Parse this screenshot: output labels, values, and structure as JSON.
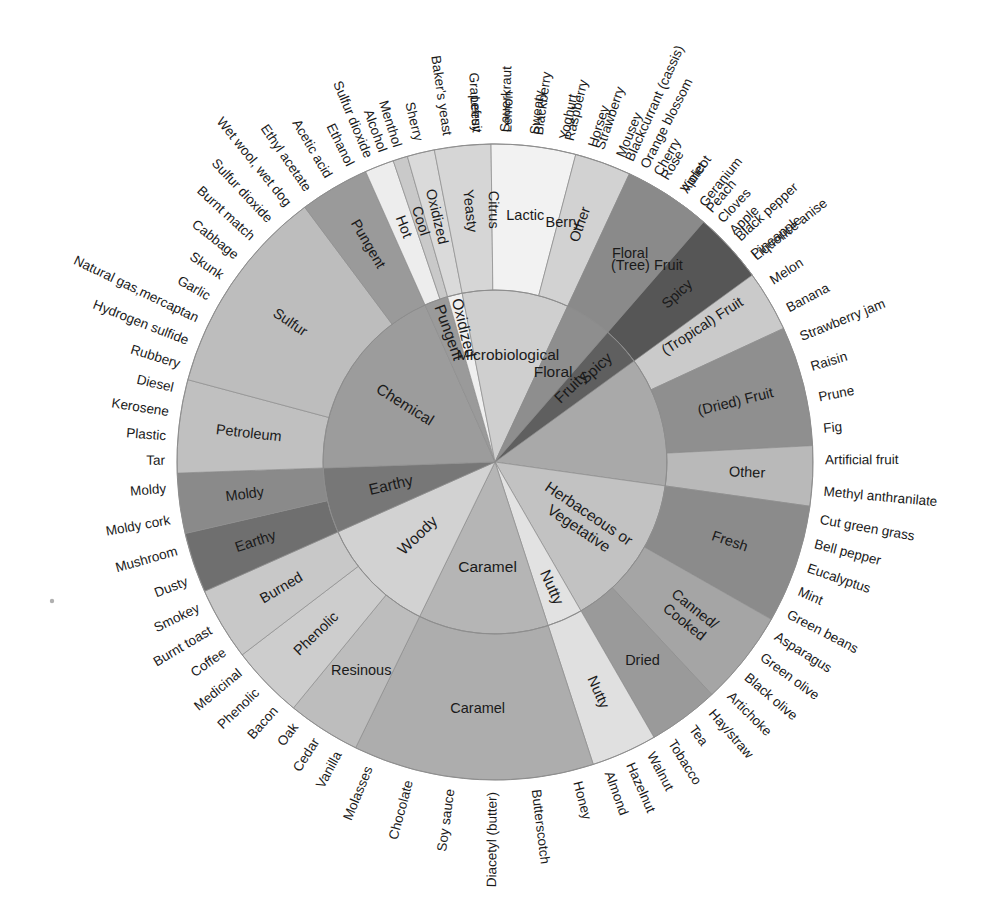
{
  "figure": {
    "name": "wine-aroma-wheel",
    "type": "sunburst",
    "center": [
      495,
      462
    ],
    "radii": {
      "inner_ring_outer": 172,
      "mid_ring_outer": 318,
      "leaf_text": 330
    },
    "palette": {
      "fruity": "#a9a9a9",
      "spicy": "#5f5f5f",
      "floral": "#8e8e8e",
      "microbiological": "#cfcfcf",
      "oxidized": "#efefef",
      "pungent": "#9a9a9a",
      "chemical": "#9c9c9c",
      "earthy": "#777777",
      "woody": "#d2d2d2",
      "caramel": "#b5b5b5",
      "nutty": "#e2e2e2",
      "herbaceous": "#c2c2c2",
      "stroke": "#8d8d8d",
      "text": "#1a1a1a"
    }
  },
  "chart_data": {
    "type": "pie",
    "levels": 3,
    "legend": "none",
    "grid": false,
    "rings": [
      "category",
      "subcategory",
      "descriptor"
    ],
    "categories": [
      {
        "label": "Fruity",
        "color": "#a9a9a9",
        "start_angle": -6,
        "sweep": 104,
        "subcategories": [
          {
            "label": "Citrus",
            "color": "#b6b6b6",
            "leaves": [
              "Grapefruit",
              "Lemon"
            ]
          },
          {
            "label": "Berry",
            "color": "#adadad",
            "leaves": [
              "Blackberry",
              "Raspberry",
              "Strawberry",
              "Blackcurrant (cassis)"
            ]
          },
          {
            "label": "(Tree) Fruit",
            "color": "#9e9e9e",
            "leaves": [
              "Cherry",
              "Apricot",
              "Peach",
              "Apple"
            ]
          },
          {
            "label": "(Tropical) Fruit",
            "color": "#cacaca",
            "leaves": [
              "Pineapple",
              "Melon",
              "Banana"
            ]
          },
          {
            "label": "(Dried) Fruit",
            "color": "#8f8f8f",
            "leaves": [
              "Strawberry jam",
              "Raisin",
              "Prune",
              "Fig"
            ]
          },
          {
            "label": "Other",
            "color": "#b9b9b9",
            "leaves": [
              "Artificial fruit",
              "Methyl anthranilate"
            ]
          }
        ]
      },
      {
        "label": "Herbaceous or Vegetative",
        "color": "#c2c2c2",
        "start_angle": 98,
        "sweep": 52,
        "subcategories": [
          {
            "label": "Fresh",
            "color": "#8b8b8b",
            "leaves": [
              "Cut green grass",
              "Bell pepper",
              "Eucalyptus",
              "Mint",
              "Green beans"
            ]
          },
          {
            "label": "Canned/ Cooked",
            "color": "#a5a5a5",
            "leaves": [
              "Asparagus",
              "Green olive",
              "Black olive",
              "Artichoke"
            ]
          },
          {
            "label": "Dried",
            "color": "#9a9a9a",
            "leaves": [
              "Hay/straw",
              "Tea",
              "Tobacco"
            ]
          }
        ]
      },
      {
        "label": "Nutty",
        "color": "#e2e2e2",
        "start_angle": 150,
        "sweep": 12,
        "subcategories": [
          {
            "label": "Nutty",
            "color": "#e0e0e0",
            "leaves": [
              "Walnut",
              "Hazelnut",
              "Almond"
            ]
          }
        ]
      },
      {
        "label": "Caramel",
        "color": "#b5b5b5",
        "start_angle": 162,
        "sweep": 44,
        "subcategories": [
          {
            "label": "Caramel",
            "color": "#adadad",
            "leaves": [
              "Honey",
              "Butterscotch",
              "Diacetyl (butter)",
              "Soy sauce",
              "Chocolate",
              "Molasses"
            ]
          }
        ]
      },
      {
        "label": "Woody",
        "color": "#d2d2d2",
        "start_angle": 206,
        "sweep": 40,
        "subcategories": [
          {
            "label": "Resinous",
            "color": "#bdbdbd",
            "leaves": [
              "Vanilla",
              "Cedar",
              "Oak"
            ]
          },
          {
            "label": "Phenolic",
            "color": "#cdcdcd",
            "leaves": [
              "Bacon",
              "Phenolic",
              "Medicinal"
            ]
          },
          {
            "label": "Burned",
            "color": "#c8c8c8",
            "leaves": [
              "Coffee",
              "Burnt toast",
              "Smokey"
            ]
          }
        ]
      },
      {
        "label": "Earthy",
        "color": "#777777",
        "start_angle": 246,
        "sweep": 22,
        "subcategories": [
          {
            "label": "Earthy",
            "color": "#6f6f6f",
            "leaves": [
              "Dusty",
              "Mushroom"
            ]
          },
          {
            "label": "Moldy",
            "color": "#8a8a8a",
            "leaves": [
              "Moldy cork",
              "Moldy"
            ]
          }
        ]
      },
      {
        "label": "Chemical",
        "color": "#9c9c9c",
        "start_angle": 268,
        "sweep": 68,
        "subcategories": [
          {
            "label": "Petroleum",
            "color": "#c0c0c0",
            "leaves": [
              "Tar",
              "Plastic",
              "Kerosene",
              "Diesel"
            ]
          },
          {
            "label": "Sulfur",
            "color": "#bdbdbd",
            "leaves": [
              "Rubbery",
              "Hydrogen sulfide",
              "Natural gas,mercaptan",
              "Garlic",
              "Skunk",
              "Cabbage",
              "Burnt match",
              "Sulfur dioxide",
              "Wet wool, wet dog"
            ]
          },
          {
            "label": "Pungent",
            "color": "#9a9a9a",
            "leaves": [
              "Ethyl acetate",
              "Acetic acid",
              "Ethanol"
            ]
          }
        ]
      },
      {
        "label": "Pungent",
        "color": "#9a9a9a",
        "start_angle": 336,
        "sweep": 8,
        "subcategories": [
          {
            "label": "Hot",
            "color": "#ededed",
            "leaves": [
              "Sulfur dioxide",
              "Alcohol"
            ]
          },
          {
            "label": "Cool",
            "color": "#c9c9c9",
            "leaves": [
              "Menthol"
            ]
          }
        ]
      },
      {
        "label": "Oxidized",
        "color": "#efefef",
        "start_angle": 344,
        "sweep": 5,
        "subcategories": [
          {
            "label": "Oxidized",
            "color": "#dadada",
            "leaves": [
              "Sherry"
            ]
          }
        ]
      },
      {
        "label": "Microbiological",
        "color": "#cfcfcf",
        "start_angle": 349,
        "sweep": 36,
        "subcategories": [
          {
            "label": "Yeasty",
            "color": "#d6d6d6",
            "leaves": [
              "Baker's yeast",
              "Leesy"
            ]
          },
          {
            "label": "Lactic",
            "color": "#f2f2f2",
            "leaves": [
              "Sauerkraut",
              "Sweaty",
              "Yoghurt"
            ]
          },
          {
            "label": "Other",
            "color": "#d2d2d2",
            "leaves": [
              "Horsey",
              "Mousey"
            ]
          }
        ]
      },
      {
        "label": "Floral",
        "color": "#8e8e8e",
        "start_angle": 25,
        "sweep": 16,
        "subcategories": [
          {
            "label": "Floral",
            "color": "#8a8a8a",
            "leaves": [
              "Orange blossom",
              "Rose",
              "Violet",
              "Geranium"
            ]
          }
        ]
      },
      {
        "label": "Spicy",
        "color": "#5f5f5f",
        "start_angle": 41,
        "sweep": 13,
        "subcategories": [
          {
            "label": "Spicy",
            "color": "#565656",
            "leaves": [
              "Cloves",
              "Black pepper",
              "Liquorice anise"
            ]
          }
        ]
      }
    ],
    "leaf_sequence_clockwise_from_top": [
      "Sulfur dioxide",
      "Alcohol",
      "Menthol",
      "Sherry",
      "Baker's yeast",
      "Leesy",
      "Sauerkraut",
      "Sweaty",
      "Yoghurt",
      "Horsey",
      "Mousey",
      "Orange blossom",
      "Rose",
      "Violet",
      "Geranium",
      "Cloves",
      "Black pepper",
      "Liquorice anise",
      "Grapefruit",
      "Lemon",
      "Blackberry",
      "Raspberry",
      "Strawberry",
      "Blackcurrant (cassis)",
      "Cherry",
      "Apricot",
      "Peach",
      "Apple",
      "Pineapple",
      "Melon",
      "Banana",
      "Strawberry jam",
      "Raisin",
      "Prune",
      "Fig",
      "Artificial fruit",
      "Methyl anthranilate",
      "Cut green grass",
      "Bell pepper",
      "Eucalyptus",
      "Mint",
      "Green beans",
      "Asparagus",
      "Green olive",
      "Black olive",
      "Artichoke",
      "Hay/straw",
      "Tea",
      "Tobacco",
      "Walnut",
      "Hazelnut",
      "Almond",
      "Honey",
      "Butterscotch",
      "Diacetyl (butter)",
      "Soy sauce",
      "Chocolate",
      "Molasses",
      "Vanilla",
      "Cedar",
      "Oak",
      "Bacon",
      "Phenolic",
      "Medicinal",
      "Coffee",
      "Burnt toast",
      "Smokey",
      "Dusty",
      "Mushroom",
      "Moldy cork",
      "Moldy",
      "Tar",
      "Plastic",
      "Kerosene",
      "Diesel",
      "Rubbery",
      "Hydrogen sulfide",
      "Natural gas,mercaptan",
      "Garlic",
      "Skunk",
      "Cabbage",
      "Burnt match",
      "Sulfur dioxide",
      "Wet wool, wet dog",
      "Ethyl acetate",
      "Acetic acid",
      "Ethanol"
    ]
  }
}
